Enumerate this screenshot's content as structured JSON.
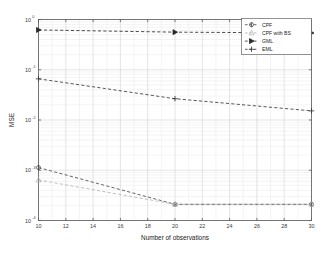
{
  "chart_data": {
    "type": "line",
    "title": "",
    "xlabel": "Number of observations",
    "ylabel": "MSE",
    "xlim": [
      10,
      30
    ],
    "ylim": [
      0.0001,
      1
    ],
    "yscale": "log",
    "xscale": "linear",
    "grid": true,
    "legend_position": "top-right",
    "x": [
      10,
      20,
      30
    ],
    "xticks": [
      "10",
      "12",
      "14",
      "16",
      "18",
      "20",
      "22",
      "24",
      "26",
      "28",
      "30"
    ],
    "xtick_values": [
      10,
      12,
      14,
      16,
      18,
      20,
      22,
      24,
      26,
      28,
      30
    ],
    "yticks": [
      "10^0",
      "10^-1",
      "10^-2",
      "10^-3",
      "10^-4"
    ],
    "ytick_values": [
      1,
      0.1,
      0.01,
      0.001,
      0.0001
    ],
    "ytick_base": "10",
    "ytick_exponents": [
      "0",
      "-1",
      "-2",
      "-3",
      "-4"
    ],
    "series": [
      {
        "name": "CPF",
        "marker": "hexagram",
        "color": "#4a4a4a",
        "x": [
          10,
          20,
          30
        ],
        "values": [
          0.00113,
          0.00021,
          0.00021
        ]
      },
      {
        "name": "CPF with BS",
        "marker": "triangle-up",
        "color": "#b4b4b4",
        "x": [
          10,
          20,
          30
        ],
        "values": [
          0.00064,
          0.00021,
          0.00021
        ]
      },
      {
        "name": "GML",
        "marker": "triangle-right",
        "color": "#2a2a2a",
        "x": [
          10,
          20,
          30
        ],
        "values": [
          0.62,
          0.56,
          0.54
        ]
      },
      {
        "name": "EML",
        "marker": "plus",
        "color": "#3a3a3a",
        "x": [
          10,
          20,
          30
        ],
        "values": [
          0.066,
          0.0265,
          0.0152
        ]
      }
    ]
  },
  "legend": {
    "entries": [
      {
        "label": "CPF"
      },
      {
        "label": "CPF with BS"
      },
      {
        "label": "GML"
      },
      {
        "label": "EML"
      }
    ]
  },
  "axes": {
    "x_title": "Number of observations",
    "y_title": "MSE"
  }
}
